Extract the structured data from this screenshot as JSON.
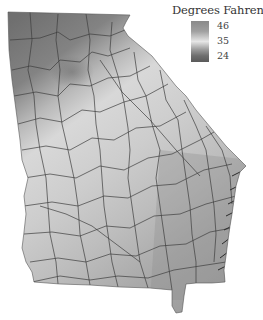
{
  "map": {
    "subject": "Georgia county map",
    "variable": "temperature",
    "shading": "grayscale"
  },
  "legend": {
    "title": "Degrees Fahrenheit",
    "ticks": [
      {
        "label": "46",
        "position": "top"
      },
      {
        "label": "35",
        "position": "middle"
      },
      {
        "label": "24",
        "position": "bottom"
      }
    ],
    "colors": {
      "top": "#8c8c8c",
      "upper": "#a6a6a6",
      "middle": "#e4e4e4",
      "lower": "#7a7a7a",
      "bottom": "#5e5e5e"
    }
  },
  "regions": {
    "north_mountain_color": "#7d7d7d",
    "piedmont_color": "#d2d2d2",
    "central_color": "#c6c6c6",
    "south_color": "#a8a8a8",
    "coast_color": "#999999",
    "county_border_color": "#3a3a3a"
  }
}
